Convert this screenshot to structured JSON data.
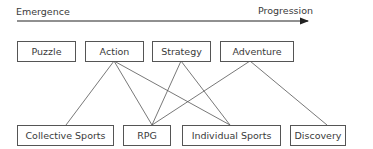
{
  "axis": {
    "left_label": "Emergence",
    "right_label": "Progression"
  },
  "top_row": [
    {
      "id": "puzzle",
      "label": "Puzzle"
    },
    {
      "id": "action",
      "label": "Action"
    },
    {
      "id": "strategy",
      "label": "Strategy"
    },
    {
      "id": "adventure",
      "label": "Adventure"
    }
  ],
  "bottom_row": [
    {
      "id": "collective-sports",
      "label": "Collective Sports"
    },
    {
      "id": "rpg",
      "label": "RPG"
    },
    {
      "id": "individual-sports",
      "label": "Individual Sports"
    },
    {
      "id": "discovery",
      "label": "Discovery"
    }
  ],
  "connections": [
    [
      "Action",
      "Collective Sports"
    ],
    [
      "Action",
      "RPG"
    ],
    [
      "Action",
      "Individual Sports"
    ],
    [
      "Strategy",
      "RPG"
    ],
    [
      "Strategy",
      "Individual Sports"
    ],
    [
      "Adventure",
      "RPG"
    ],
    [
      "Adventure",
      "Discovery"
    ]
  ],
  "colors": {
    "line": "#555555",
    "text": "#3a3a3a"
  }
}
